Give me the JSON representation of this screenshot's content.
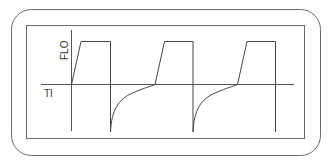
{
  "diagram": {
    "labels": {
      "y_axis": "FLO",
      "x_axis": "TI"
    },
    "waveform": {
      "type": "square-pulse-with-exponential-recovery",
      "cycles": 3,
      "description": "Square inspiratory flow pulses followed by negative expiratory flow spikes that decay exponentially back to zero"
    },
    "colors": {
      "line": "#444444",
      "frame": "#6a6a6a",
      "background": "#ffffff"
    }
  }
}
